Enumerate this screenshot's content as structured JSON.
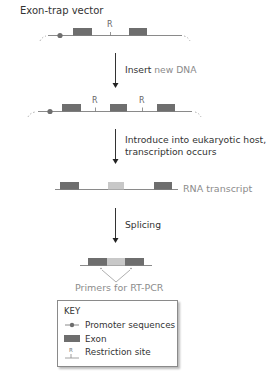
{
  "title": "Exon-trap vector",
  "steps": [
    {
      "label_bold": "Insert",
      "label_rest": " new DNA"
    },
    {
      "line1": "Introduce into eukaryotic host,",
      "line2": "transcription occurs"
    },
    {
      "label": "Splicing"
    }
  ],
  "vector": {
    "restriction_label": "R"
  },
  "rna": {
    "label": "RNA transcript"
  },
  "spliced": {
    "primers_label": "Primers for RT-PCR"
  },
  "key": {
    "title": "KEY",
    "items": [
      {
        "icon": "promoter-icon",
        "label": "Promoter sequences"
      },
      {
        "icon": "exon-icon",
        "label": "Exon"
      },
      {
        "icon": "restriction-site-icon",
        "label": "Restriction site"
      }
    ]
  },
  "colors": {
    "exon_dark": "#6e6e6e",
    "exon_light": "#c8c8c8",
    "line": "#8a8a8a",
    "text": "#333333",
    "muted_text": "#8c8c8c"
  }
}
